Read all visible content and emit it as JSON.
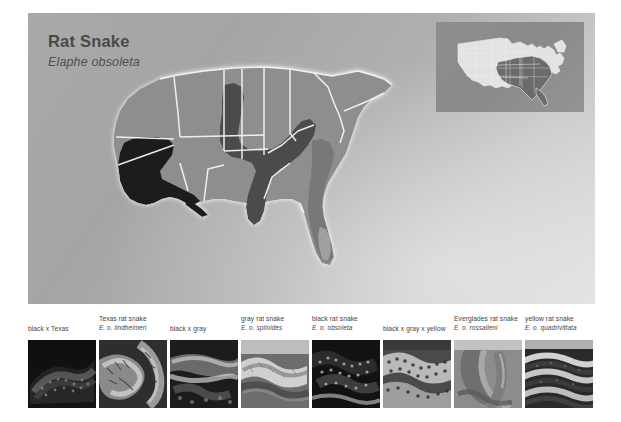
{
  "page": {
    "background": "#ffffff",
    "panel_bg_light": "#dcdcdc",
    "panel_bg_dark": "#a5a5a5"
  },
  "header": {
    "title": "Rat Snake",
    "scientific_name": "Elaphe obsoleta"
  },
  "inset_map": {
    "name": "united-states-locator-map",
    "highlight_color": "#6e6e6e",
    "base_color": "#e6e6e6"
  },
  "range_map": {
    "name": "southeastern-united-states-range-map",
    "regions": [
      {
        "label": "black x Texas",
        "color": "#1b1b1b"
      },
      {
        "label": "gray / black range",
        "color": "#8c8c8c"
      },
      {
        "label": "intergrade zone",
        "color": "#4d4d4d"
      },
      {
        "label": "yellow range",
        "color": "#777777"
      },
      {
        "label": "Everglades range",
        "color": "#9e9e9e"
      }
    ]
  },
  "specimens": [
    {
      "common": "black x Texas",
      "scientific": ""
    },
    {
      "common": "Texas rat snake",
      "scientific": "E. o. lindheimeri"
    },
    {
      "common": "black x gray",
      "scientific": ""
    },
    {
      "common": "gray rat snake",
      "scientific": "E. o. spiloides"
    },
    {
      "common": "black rat snake",
      "scientific": "E. o. obsoleta"
    },
    {
      "common": "black x gray x yellow",
      "scientific": ""
    },
    {
      "common": "Everglades rat snake",
      "scientific": "E. o. rossalleni"
    },
    {
      "common": "yellow rat snake",
      "scientific": "E. o. quadrivittata"
    }
  ]
}
